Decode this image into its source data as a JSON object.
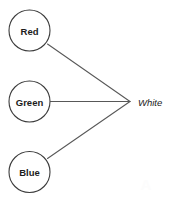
{
  "diagram": {
    "type": "convergence-diagram",
    "canvas": {
      "width": 170,
      "height": 201,
      "background": "#ffffff"
    },
    "colors": {
      "node_stroke": "#3c3c3c",
      "node_fill": "#ffffff",
      "edge_stroke": "#585858",
      "label_text": "#1c1c1c"
    },
    "nodes": [
      {
        "id": "red",
        "label": "Red",
        "shape": "circle",
        "cx": 29.5,
        "cy": 30.5,
        "r": 20.5
      },
      {
        "id": "green",
        "label": "Green",
        "shape": "circle",
        "cx": 29.5,
        "cy": 101.5,
        "r": 20.5
      },
      {
        "id": "blue",
        "label": "Blue",
        "shape": "circle",
        "cx": 29.5,
        "cy": 172.0,
        "r": 20.5
      }
    ],
    "output": {
      "id": "white",
      "label": "White",
      "style": "italic",
      "x": 138,
      "y": 101.5,
      "vertex_x": 130,
      "vertex_y": 101.5
    },
    "edges": [
      {
        "id": "red-to-white",
        "from": "red",
        "to": "white",
        "x1": 47.5,
        "y1": 44.0,
        "x2": 130,
        "y2": 101.5
      },
      {
        "id": "green-to-white",
        "from": "green",
        "to": "white",
        "x1": 50.5,
        "y1": 101.5,
        "x2": 130,
        "y2": 101.5
      },
      {
        "id": "blue-to-white",
        "from": "blue",
        "to": "white",
        "x1": 47.5,
        "y1": 158.5,
        "x2": 130,
        "y2": 101.5
      }
    ],
    "watermark": {
      "text": "A",
      "x": 146,
      "y": 184
    }
  }
}
